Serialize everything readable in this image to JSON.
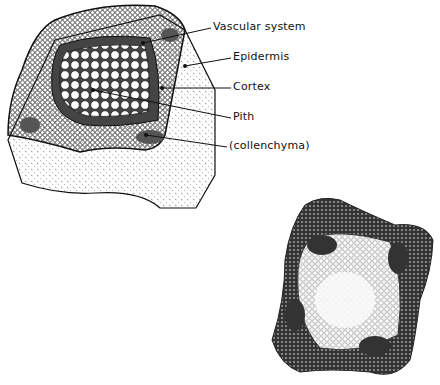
{
  "diagram": {
    "labels": [
      {
        "id": "vascular-system",
        "text": "Vascular system",
        "x": 213,
        "y": 20,
        "target": [
          143,
          43
        ]
      },
      {
        "id": "epidermis",
        "text": "Epidermis",
        "x": 233,
        "y": 50,
        "target": [
          185,
          66
        ]
      },
      {
        "id": "cortex",
        "text": "Cortex",
        "x": 233,
        "y": 80,
        "target": [
          162,
          88
        ]
      },
      {
        "id": "pith",
        "text": "Pith",
        "x": 233,
        "y": 110,
        "target": [
          93,
          90
        ]
      },
      {
        "id": "collenchyma",
        "text": "(collenchyma)",
        "x": 229,
        "y": 139,
        "target": [
          146,
          135
        ]
      }
    ],
    "colors": {
      "ink": "#111111",
      "background": "#ffffff",
      "shade": "#555555"
    }
  }
}
